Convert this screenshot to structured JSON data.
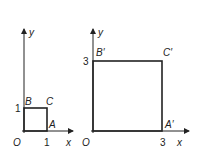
{
  "diagram": {
    "left_graph": {
      "axis_x_label": "x",
      "axis_y_label": "y",
      "origin_label": "O",
      "tick_x": "1",
      "tick_y": "1",
      "vertices": {
        "A": "A",
        "B": "B",
        "C": "C"
      }
    },
    "right_graph": {
      "axis_x_label": "x",
      "axis_y_label": "y",
      "origin_label": "O",
      "tick_x": "3",
      "tick_y": "3",
      "vertices": {
        "A": "A′",
        "B": "B′",
        "C": "C′"
      }
    },
    "colors": {
      "line": "#222222",
      "background": "#ffffff"
    }
  }
}
